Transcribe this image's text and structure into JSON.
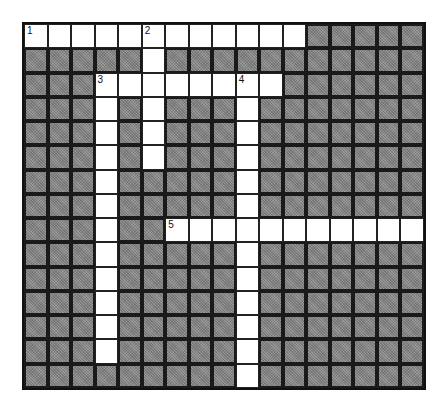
{
  "puzzle": {
    "type": "crossword",
    "cols": 17,
    "rows": 15,
    "colors": {
      "block": "#8c8c8c",
      "open": "#ffffff",
      "line": "#111111"
    },
    "entries": [
      {
        "number": "1",
        "direction": "across",
        "row": 0,
        "col": 0,
        "length": 12
      },
      {
        "number": "2",
        "direction": "down",
        "row": 0,
        "col": 5,
        "length": 6
      },
      {
        "number": "3",
        "direction": "across",
        "row": 2,
        "col": 3,
        "length": 8
      },
      {
        "number": "3",
        "direction": "down",
        "row": 2,
        "col": 3,
        "length": 12
      },
      {
        "number": "4",
        "direction": "down",
        "row": 2,
        "col": 9,
        "length": 13
      },
      {
        "number": "5",
        "direction": "across",
        "row": 8,
        "col": 6,
        "length": 11
      }
    ],
    "numbers": [
      {
        "label": "1",
        "row": 0,
        "col": 0
      },
      {
        "label": "2",
        "row": 0,
        "col": 5
      },
      {
        "label": "3",
        "row": 2,
        "col": 3
      },
      {
        "label": "4",
        "row": 2,
        "col": 9
      },
      {
        "label": "5",
        "row": 8,
        "col": 6
      }
    ]
  }
}
